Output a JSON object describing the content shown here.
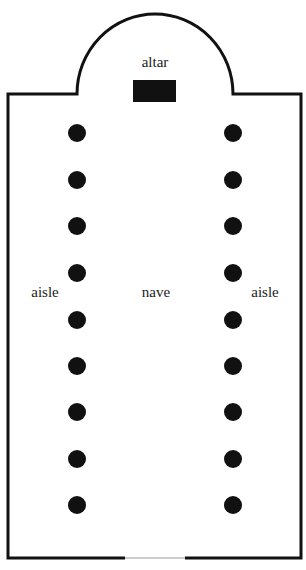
{
  "labels": {
    "altar": "altar",
    "nave": "nave",
    "aisle_left": "aisle",
    "aisle_right": "aisle"
  },
  "colors": {
    "wall": "#111111",
    "column": "#111111",
    "altar": "#111111",
    "background": "#ffffff"
  },
  "plan": {
    "columns_per_side": 9,
    "column_rows_y": [
      133,
      180,
      226,
      273,
      320,
      366,
      412,
      459,
      505
    ],
    "left_column_x": 77,
    "right_column_x": 233
  }
}
